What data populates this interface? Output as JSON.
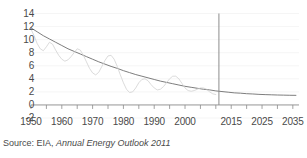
{
  "chart_data": {
    "type": "line",
    "title": "",
    "xlabel": "",
    "ylabel": "",
    "xlim": [
      1950,
      2037
    ],
    "ylim": [
      -2,
      14
    ],
    "grid": true,
    "legend": "none",
    "y_ticks": [
      14,
      12,
      10,
      8,
      6,
      4,
      2,
      0,
      -2
    ],
    "y_tick_labels": [
      "14",
      "12",
      "10",
      "8",
      "6",
      "4",
      "2",
      "0",
      "-2"
    ],
    "x_ticks": [
      1950,
      1955,
      1960,
      1965,
      1970,
      1975,
      1980,
      1985,
      1990,
      1995,
      2000,
      2005,
      2010,
      2015,
      2020,
      2025,
      2030,
      2035
    ],
    "x_tick_labels": [
      "1950",
      "1960",
      "1970",
      "1980",
      "1990",
      "2000",
      "2015",
      "2025",
      "2035"
    ],
    "x_tick_label_values": [
      1950,
      1960,
      1970,
      1980,
      1990,
      2000,
      2015,
      2025,
      2035
    ],
    "annotations": [
      {
        "name": "history-projection-divider",
        "type": "vline",
        "x": 2011,
        "y_from": 0,
        "y_to": 14
      }
    ],
    "series": [
      {
        "name": "smooth-trend",
        "color": "#6e6e6e",
        "width": 0.9,
        "x": [
          1950,
          1952,
          1954,
          1956,
          1958,
          1960,
          1962,
          1964,
          1966,
          1968,
          1970,
          1972,
          1974,
          1976,
          1978,
          1980,
          1982,
          1984,
          1986,
          1988,
          1990,
          1992,
          1994,
          1996,
          1998,
          2000,
          2002,
          2004,
          2006,
          2008,
          2010,
          2012,
          2014,
          2016,
          2018,
          2020,
          2022,
          2024,
          2026,
          2028,
          2030,
          2032,
          2034,
          2036
        ],
        "values": [
          11.8,
          11.2,
          10.6,
          10.1,
          9.6,
          9.1,
          8.6,
          8.2,
          7.8,
          7.4,
          7.0,
          6.6,
          6.25,
          5.9,
          5.6,
          5.25,
          4.95,
          4.65,
          4.4,
          4.15,
          3.9,
          3.65,
          3.45,
          3.25,
          3.05,
          2.85,
          2.7,
          2.55,
          2.4,
          2.3,
          2.15,
          2.05,
          1.95,
          1.85,
          1.8,
          1.72,
          1.68,
          1.62,
          1.58,
          1.55,
          1.52,
          1.5,
          1.48,
          1.47
        ]
      },
      {
        "name": "volatile-actual",
        "color": "#d2d2d2",
        "width": 0.8,
        "x": [
          1950,
          1951,
          1952,
          1953,
          1954,
          1955,
          1956,
          1957,
          1958,
          1959,
          1960,
          1961,
          1962,
          1963,
          1964,
          1965,
          1966,
          1967,
          1968,
          1969,
          1970,
          1971,
          1972,
          1973,
          1974,
          1975,
          1976,
          1977,
          1978,
          1979,
          1980,
          1981,
          1982,
          1983,
          1984,
          1985,
          1986,
          1987,
          1988,
          1989,
          1990,
          1991,
          1992,
          1993,
          1994,
          1995,
          1996,
          1997,
          1998,
          1999,
          2000,
          2001,
          2002,
          2003,
          2004,
          2005,
          2006,
          2007,
          2008,
          2009,
          2010
        ],
        "values": [
          11.6,
          10.6,
          9.4,
          8.6,
          8.3,
          8.9,
          9.6,
          9.3,
          8.4,
          7.6,
          7.0,
          6.7,
          6.9,
          7.4,
          8.0,
          8.6,
          8.4,
          7.6,
          6.6,
          5.6,
          4.9,
          4.6,
          5.0,
          5.9,
          6.8,
          7.5,
          7.6,
          7.0,
          5.9,
          4.6,
          3.4,
          2.4,
          1.9,
          2.0,
          2.6,
          3.4,
          3.9,
          4.0,
          3.7,
          3.1,
          2.6,
          2.3,
          2.4,
          2.8,
          3.4,
          4.0,
          4.4,
          4.4,
          4.0,
          3.3,
          2.6,
          2.2,
          2.1,
          2.2,
          2.4,
          2.6,
          2.6,
          2.4,
          2.0,
          1.7,
          1.6
        ]
      }
    ]
  },
  "source": {
    "prefix": "Source:  EIA, ",
    "title": "Annual Energy Outlook 2011"
  }
}
